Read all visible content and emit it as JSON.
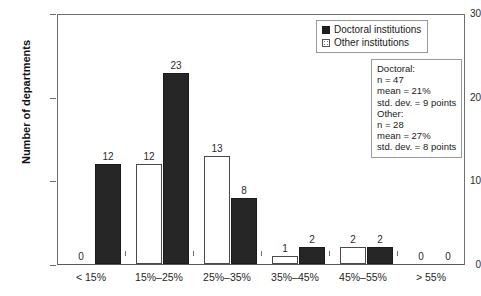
{
  "chart_data": {
    "type": "bar",
    "title": "",
    "subtitle": "",
    "xlabel": "",
    "ylabel": "Number of departments",
    "ylim": [
      0,
      30
    ],
    "yticks": [
      0,
      10,
      20,
      30
    ],
    "grid": false,
    "legend_position": "top-right",
    "categories": [
      "< 15%",
      "15%–25%",
      "25%–35%",
      "35%–45%",
      "45%–55%",
      "> 55%"
    ],
    "series": [
      {
        "name": "Other institutions",
        "values": [
          0,
          12,
          13,
          1,
          2,
          0
        ],
        "fill": "dotted-white",
        "color": "#ffffff"
      },
      {
        "name": "Doctoral institutions",
        "values": [
          12,
          23,
          8,
          2,
          2,
          0
        ],
        "fill": "solid-black",
        "color": "#262626"
      }
    ],
    "bar_value_labels": true,
    "annotations": [
      "Doctoral:",
      "n = 47",
      "mean = 21%",
      "std. dev. = 9 points",
      "Other:",
      "n = 28",
      "mean = 27%",
      "std. dev. = 8 points"
    ]
  },
  "axes": {
    "y": {
      "label": "Number of departments",
      "ticks": [
        {
          "value": 30,
          "label": "30"
        },
        {
          "value": 20,
          "label": "20"
        },
        {
          "value": 10,
          "label": "10"
        },
        {
          "value": 0,
          "label": "0"
        }
      ]
    },
    "x": {
      "ticks": [
        {
          "label": "< 15%"
        },
        {
          "label": "15%–25%"
        },
        {
          "label": "25%–35%"
        },
        {
          "label": "35%–45%"
        },
        {
          "label": "45%–55%"
        },
        {
          "label": "> 55%"
        }
      ]
    }
  },
  "legend": {
    "items": [
      {
        "label": "Doctoral institutions",
        "swatch": "solid-black-square"
      },
      {
        "label": "Other institutions",
        "swatch": "dotted-white-square"
      }
    ]
  },
  "stats": {
    "lines": [
      "Doctoral:",
      "n = 47",
      "mean = 21%",
      "std. dev. = 9 points",
      "Other:",
      "n = 28",
      "mean = 27%",
      "std. dev. = 8 points"
    ]
  },
  "colors": {
    "doctoral_fill": "#262626",
    "other_fill": "#ffffff",
    "axis": "#6e6e6e",
    "text": "#1a1a1a",
    "background": "#ffffff"
  }
}
